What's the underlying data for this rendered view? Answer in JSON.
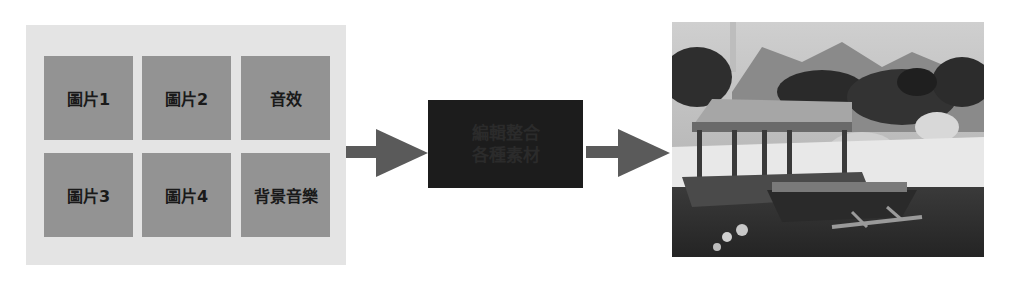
{
  "diagram": {
    "title": "",
    "source_panel": {
      "tiles": [
        {
          "label": "圖片1"
        },
        {
          "label": "圖片2"
        },
        {
          "label": "音效"
        },
        {
          "label": "圖片3"
        },
        {
          "label": "圖片4"
        },
        {
          "label": "背景音樂"
        }
      ]
    },
    "process_box": {
      "line1": "編輯整合",
      "line2": "各種素材"
    },
    "output": {
      "description": "rendered 3D tropical beach scene with thatched hut and outrigger boat"
    },
    "colors": {
      "panel_bg": "#e4e4e4",
      "tile_bg": "#939393",
      "tile_text": "#1a1a1a",
      "arrow": "#5a5a5a",
      "process_bg": "#1c1c1c"
    }
  }
}
